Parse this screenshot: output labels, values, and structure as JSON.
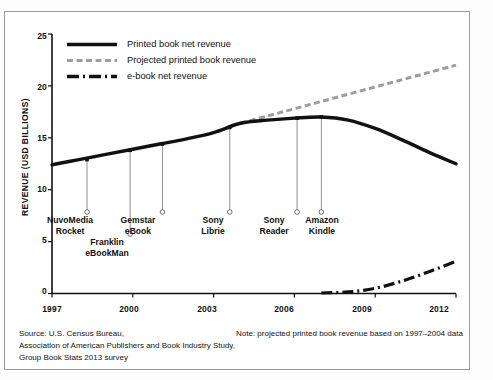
{
  "chart_data": {
    "type": "line",
    "title": "",
    "xlabel": "",
    "ylabel": "REVENUE (USD BILLIONS)",
    "xlim": [
      1997,
      2012
    ],
    "ylim": [
      0,
      25
    ],
    "grid": false,
    "legend_position": "top-left",
    "x_ticks": [
      "1997",
      "2000",
      "2003",
      "2006",
      "2009",
      "2012"
    ],
    "y_ticks": [
      "0",
      "5",
      "10",
      "15",
      "20",
      "25"
    ],
    "series": [
      {
        "name": "Printed book net revenue",
        "style": "solid",
        "color": "#111111",
        "x": [
          1997,
          1998,
          1999,
          2000,
          2001,
          2002,
          2003,
          2004,
          2005,
          2006,
          2007,
          2008,
          2009,
          2010,
          2011,
          2012
        ],
        "values": [
          12.4,
          12.9,
          13.4,
          13.9,
          14.4,
          14.9,
          15.5,
          16.4,
          16.7,
          16.9,
          17.0,
          16.7,
          15.9,
          14.8,
          13.6,
          12.5
        ]
      },
      {
        "name": "Projected printed book revenue",
        "style": "dashed",
        "color": "#9d9d9d",
        "x": [
          2004,
          2005,
          2006,
          2007,
          2008,
          2009,
          2010,
          2011,
          2012
        ],
        "values": [
          16.4,
          17.1,
          17.8,
          18.5,
          19.2,
          19.9,
          20.6,
          21.3,
          22.0
        ]
      },
      {
        "name": "e-book net revenue",
        "style": "dashdot",
        "color": "#111111",
        "x": [
          2007,
          2008,
          2009,
          2010,
          2011,
          2012
        ],
        "values": [
          0.05,
          0.15,
          0.5,
          1.2,
          2.1,
          3.1
        ]
      }
    ],
    "annotations": [
      {
        "label_line1": "NuvoMedia",
        "label_line2": "Rocket",
        "year": 1998.3,
        "value": 12.9
      },
      {
        "label_line1": "Franklin",
        "label_line2": "eBookMan",
        "year": 1999.9,
        "value": 13.8
      },
      {
        "label_line1": "Gemstar",
        "label_line2": "eBook",
        "year": 2001.1,
        "value": 14.4
      },
      {
        "label_line1": "Sony",
        "label_line2": "Librie",
        "year": 2003.6,
        "value": 16.0
      },
      {
        "label_line1": "Sony",
        "label_line2": "Reader",
        "year": 2006.1,
        "value": 16.9
      },
      {
        "label_line1": "Amazon",
        "label_line2": "Kindle",
        "year": 2007.0,
        "value": 17.0
      }
    ]
  },
  "legend": {
    "items": [
      {
        "label": "Printed book net revenue"
      },
      {
        "label": "Projected printed book revenue"
      },
      {
        "label": "e-book net revenue"
      }
    ]
  },
  "footer": {
    "source_line1": "Source: U.S. Census Bureau,",
    "source_line2": "Association of American Publishers and Book Industry Study,",
    "source_line3": "Group Book Stats 2013 survey",
    "note": "Note:  projected printed book revenue based on 1997–2004 data"
  }
}
